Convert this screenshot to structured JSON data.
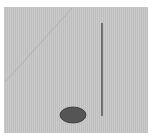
{
  "canvas": {
    "background": "#c4c4c4",
    "border": "#ffffff"
  },
  "shapes": {
    "diagonal_line": {
      "x1": 72,
      "y1": 8,
      "x2": 5,
      "y2": 82,
      "color": "#b0b0b0"
    },
    "vertical_line": {
      "x": 102,
      "y1": 23,
      "y2": 116,
      "color": "#444444"
    },
    "ellipse": {
      "cx": 73,
      "cy": 115,
      "rx": 13,
      "ry": 8,
      "fill": "#555555",
      "stroke": "#333333"
    }
  }
}
